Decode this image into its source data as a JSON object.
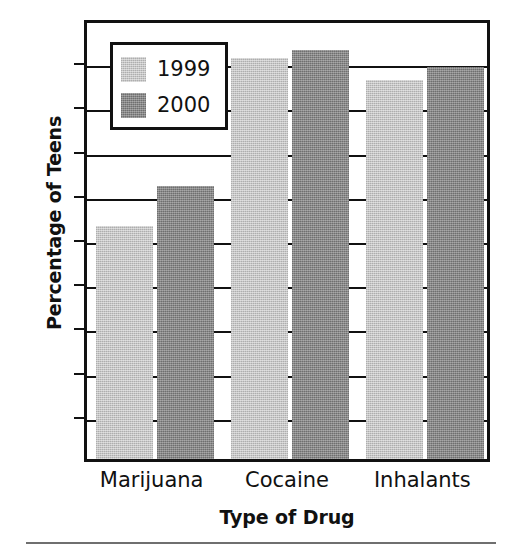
{
  "chart_data": {
    "type": "bar",
    "title": "",
    "xlabel": "Type of Drug",
    "ylabel": "Percentage of Teens",
    "categories": [
      "Marijuana",
      "Cocaine",
      "Inhalants"
    ],
    "series": [
      {
        "name": "1999",
        "color": "#b9b9b9",
        "values": [
          52.7,
          90.7,
          85.7
        ]
      },
      {
        "name": "2000",
        "color": "#828282",
        "values": [
          61.8,
          92.5,
          88.7
        ]
      }
    ],
    "ylim": [
      0,
      100
    ],
    "yticks": [
      100,
      90,
      80,
      70,
      60,
      50,
      40,
      30,
      20,
      10,
      0
    ],
    "ytick_labels": [
      "100",
      "90",
      "80",
      "70",
      "60",
      "50",
      "40",
      "30",
      "20",
      "10",
      "0"
    ],
    "grid": true,
    "legend_position": "upper-left-inside"
  }
}
